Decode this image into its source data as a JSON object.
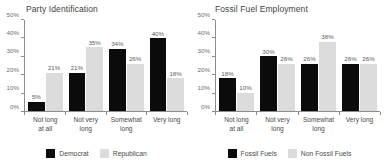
{
  "chart_data": [
    {
      "type": "bar",
      "title": "Party Identification",
      "xlabel": "",
      "ylabel": "",
      "ylim": [
        0,
        50
      ],
      "grid": false,
      "legend_position": "bottom",
      "ytick_labels": [
        "0%",
        "10%",
        "20%",
        "30%",
        "40%",
        "50%"
      ],
      "ytick_values": [
        0,
        10,
        20,
        30,
        40,
        50
      ],
      "categories": [
        "Not long at all",
        "Not very long",
        "Somewhat long",
        "Very long"
      ],
      "category_lines": [
        [
          "Not long",
          "at all"
        ],
        [
          "Not very",
          "long"
        ],
        [
          "Somewhat",
          "long"
        ],
        [
          "Very long"
        ]
      ],
      "series": [
        {
          "name": "Democrat",
          "color": "#0b0b0b",
          "values": [
            5,
            21,
            34,
            40
          ],
          "labels": [
            "5%",
            "21%",
            "34%",
            "40%"
          ]
        },
        {
          "name": "Republican",
          "color": "#dcdcdc",
          "values": [
            21,
            35,
            26,
            18
          ],
          "labels": [
            "21%",
            "35%",
            "26%",
            "18%"
          ]
        }
      ]
    },
    {
      "type": "bar",
      "title": "Fossil Fuel Employment",
      "xlabel": "",
      "ylabel": "",
      "ylim": [
        0,
        50
      ],
      "grid": false,
      "legend_position": "bottom",
      "ytick_labels": [
        "0%",
        "10%",
        "20%",
        "30%",
        "40%",
        "50%"
      ],
      "ytick_values": [
        0,
        10,
        20,
        30,
        40,
        50
      ],
      "categories": [
        "Not long at all",
        "Not very long",
        "Somewhat long",
        "Very long"
      ],
      "category_lines": [
        [
          "Not long",
          "at all"
        ],
        [
          "Not very",
          "long"
        ],
        [
          "Somewhat",
          "long"
        ],
        [
          "Very long"
        ]
      ],
      "series": [
        {
          "name": "Fossil Fuels",
          "color": "#0b0b0b",
          "values": [
            18,
            30,
            26,
            26
          ],
          "labels": [
            "18%",
            "30%",
            "26%",
            "26%"
          ]
        },
        {
          "name": "Non Fossil Fuels",
          "color": "#dcdcdc",
          "values": [
            10,
            26,
            38,
            26
          ],
          "labels": [
            "10%",
            "26%",
            "38%",
            "26%"
          ]
        }
      ]
    }
  ],
  "colors": {
    "dark_series": "#0b0b0b",
    "light_series": "#dcdcdc",
    "axis": "#8c8c8c",
    "text": "#4a4a4a",
    "background": "#ffffff"
  }
}
